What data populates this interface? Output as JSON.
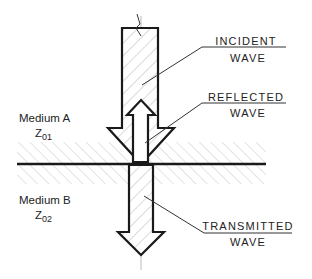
{
  "diagram": {
    "labels": {
      "incident": [
        "INCIDENT",
        "WAVE"
      ],
      "reflected": [
        "REFLECTED",
        "WAVE"
      ],
      "transmitted": [
        "TRANSMITTED",
        "WAVE"
      ]
    },
    "media": {
      "a": {
        "name": "Medium A",
        "z": "Z",
        "sub": "01"
      },
      "b": {
        "name": "Medium B",
        "z": "Z",
        "sub": "02"
      }
    },
    "colors": {
      "line": "#1a1a1a",
      "hatch": "#b0b0b0",
      "leader": "#333333"
    }
  }
}
